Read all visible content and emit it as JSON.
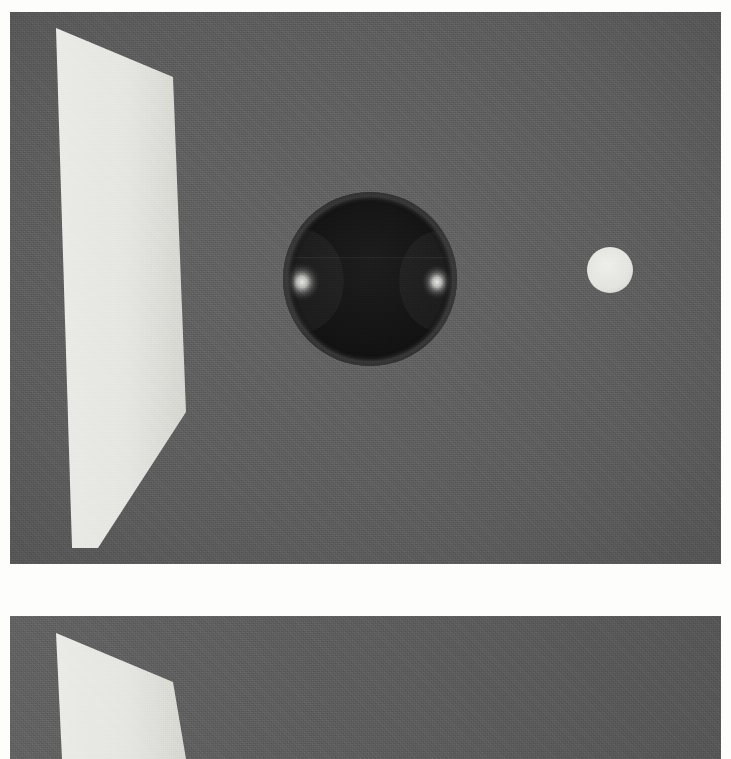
{
  "document": {
    "title": "Rendered 3D Scene — Two Frames",
    "kind": "computer-generated imagery",
    "color_mode": "grayscale",
    "width": 731,
    "height": 759,
    "page_background": "#fdfdfb",
    "frame_count": 2,
    "separator_gap_color": "#fdfdfb"
  },
  "palette": {
    "background_gray": "#5e5e5e",
    "background_gray_dark": "#575757",
    "panel_white": "#e8e8e4",
    "panel_white_shaded": "#d9d9d4",
    "sphere_body": "#161616",
    "sphere_body_edge": "#2e2e2e",
    "sphere_rim": "#3a3a3a",
    "highlight_white": "#f2f2ee",
    "disc_white": "#e6e6e2",
    "paper_white": "#fdfdfb"
  },
  "frames": [
    {
      "id": "frame-top",
      "name": "upper-render-frame",
      "label": "Upper frame",
      "bounds": {
        "x": 10,
        "y": 12,
        "width": 721,
        "height": 552
      },
      "background": "#5e5e5e",
      "objects": [
        {
          "id": "panel-top",
          "name": "white-panel",
          "label": "White perspective panel",
          "type": "quad",
          "fill": "#e8e8e4",
          "points": "56,16 173,65 186,400 98,536 72,536"
        },
        {
          "id": "sphere-top",
          "name": "dark-sphere",
          "label": "Dark glossy sphere",
          "type": "sphere",
          "cx": 370,
          "cy": 267,
          "r": 87,
          "fill": "#161616",
          "highlights": [
            {
              "name": "specular-highlight-left",
              "cx": 302,
              "cy": 270,
              "rx": 19,
              "ry": 20
            },
            {
              "name": "specular-highlight-right",
              "cx": 437,
              "cy": 270,
              "rx": 16,
              "ry": 18
            }
          ]
        },
        {
          "id": "disc-top",
          "name": "white-disc",
          "label": "Small white disc",
          "type": "circle",
          "cx": 610,
          "cy": 258,
          "r": 23,
          "fill": "#e6e6e2"
        }
      ]
    },
    {
      "id": "frame-bottom",
      "name": "lower-render-frame",
      "label": "Lower frame",
      "bounds": {
        "x": 10,
        "y": 616,
        "width": 721,
        "height": 143
      },
      "background": "#5e5e5e",
      "objects": [
        {
          "id": "panel-bottom",
          "name": "white-panel",
          "label": "White perspective panel",
          "type": "quad",
          "fill": "#e8e8e4",
          "points": "56,17 173,66 186,143 62,143"
        }
      ]
    }
  ],
  "chart_data": {
    "type": "scatter",
    "xlabel": "x (px)",
    "ylabel": "y (px)",
    "xlim": [
      0,
      731
    ],
    "ylim": [
      0,
      759
    ],
    "grid": false,
    "legend": "none",
    "series": [
      {
        "name": "upper frame objects",
        "points": [
          {
            "label": "white panel (centroid)",
            "x": 124,
            "y": 284
          },
          {
            "label": "dark sphere (center)",
            "x": 380,
            "y": 279
          },
          {
            "label": "white disc (center)",
            "x": 620,
            "y": 270
          }
        ]
      },
      {
        "name": "lower frame objects",
        "points": [
          {
            "label": "white panel (centroid)",
            "x": 124,
            "y": 700
          }
        ]
      }
    ],
    "annotations": [
      "upper frame spans y 12–564",
      "white gap spans y 564–616",
      "lower frame spans y 616–759"
    ]
  }
}
